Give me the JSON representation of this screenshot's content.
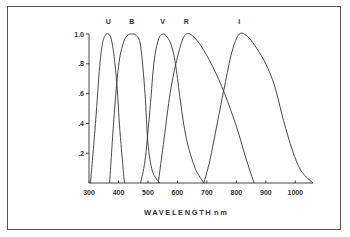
{
  "chart_data": {
    "type": "line",
    "title": "",
    "xlabel": "WAVELENGTH",
    "xunit": "nm",
    "ylabel": "",
    "xlim": [
      300,
      1060
    ],
    "ylim": [
      0,
      1.0
    ],
    "x_ticks": [
      300,
      400,
      500,
      600,
      700,
      800,
      900,
      1000
    ],
    "x_tick_labels": [
      "300",
      "400",
      "500",
      "600",
      "700",
      "800",
      "900",
      "1000"
    ],
    "y_ticks": [
      0.2,
      0.4,
      0.6,
      0.8,
      1.0
    ],
    "y_tick_labels": [
      ".2",
      ".4",
      ".6",
      ".8",
      "1.0"
    ],
    "grid": false,
    "legend": "none (curves labeled directly above peaks)",
    "series": [
      {
        "name": "U",
        "label_x": 365,
        "x": [
          305,
          320,
          335,
          345,
          355,
          365,
          375,
          385,
          395,
          405,
          420
        ],
        "y": [
          0.0,
          0.35,
          0.75,
          0.93,
          0.99,
          1.0,
          0.97,
          0.85,
          0.65,
          0.35,
          0.0
        ]
      },
      {
        "name": "B",
        "label_x": 445,
        "x": [
          370,
          385,
          400,
          415,
          430,
          445,
          460,
          475,
          490,
          500,
          515,
          540
        ],
        "y": [
          0.0,
          0.45,
          0.78,
          0.93,
          0.99,
          1.0,
          0.99,
          0.92,
          0.6,
          0.27,
          0.08,
          0.0
        ]
      },
      {
        "name": "V",
        "label_x": 550,
        "x": [
          475,
          490,
          505,
          520,
          535,
          550,
          565,
          580,
          595,
          610,
          630,
          660,
          690
        ],
        "y": [
          0.0,
          0.15,
          0.45,
          0.8,
          0.96,
          1.0,
          0.98,
          0.92,
          0.78,
          0.55,
          0.3,
          0.1,
          0.0
        ]
      },
      {
        "name": "R",
        "label_x": 630,
        "x": [
          535,
          555,
          575,
          595,
          615,
          630,
          650,
          680,
          720,
          760,
          800,
          835,
          860
        ],
        "y": [
          0.0,
          0.3,
          0.6,
          0.8,
          0.95,
          1.0,
          0.99,
          0.92,
          0.78,
          0.6,
          0.38,
          0.15,
          0.0
        ]
      },
      {
        "name": "I",
        "label_x": 810,
        "x": [
          690,
          710,
          735,
          760,
          785,
          810,
          840,
          870,
          900,
          930,
          960,
          990,
          1020,
          1060
        ],
        "y": [
          0.0,
          0.15,
          0.4,
          0.65,
          0.88,
          1.0,
          0.98,
          0.9,
          0.8,
          0.65,
          0.42,
          0.22,
          0.08,
          0.0
        ]
      }
    ]
  },
  "axis": {
    "x_title": "WAVELENGTH",
    "x_unit": "nm"
  }
}
